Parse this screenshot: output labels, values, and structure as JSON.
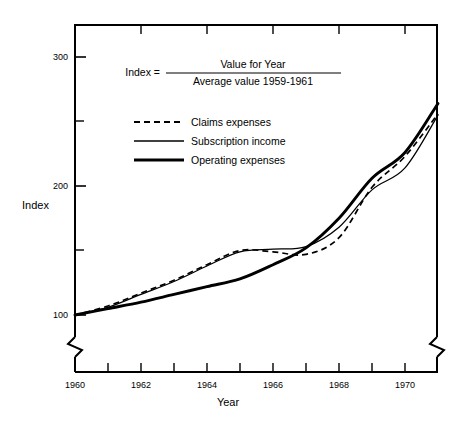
{
  "chart_data": {
    "type": "line",
    "title": "",
    "xlabel": "Year",
    "ylabel": "Index",
    "xlim": [
      1960,
      1971
    ],
    "ylim": [
      95,
      310
    ],
    "grid": false,
    "y_axis_break": true,
    "legend_position": "inside-top-left",
    "x_tick_labels": [
      "1960",
      "1962",
      "1964",
      "1966",
      "1968",
      "1970"
    ],
    "x_tick_label_values": [
      1960,
      1962,
      1964,
      1966,
      1968,
      1970
    ],
    "x_minor_ticks": [
      1961,
      1963,
      1965,
      1967,
      1969,
      1971
    ],
    "y_tick_labels": [
      "100",
      "200",
      "300"
    ],
    "y_tick_label_values": [
      100,
      200,
      300
    ],
    "y_minor_ticks": [
      150,
      250
    ],
    "x": [
      1960,
      1961,
      1962,
      1963,
      1964,
      1965,
      1966,
      1967,
      1968,
      1969,
      1970,
      1971
    ],
    "series": [
      {
        "name": "Claims expenses",
        "style": "dashed",
        "values": [
          100,
          107,
          117,
          127,
          139,
          150,
          149,
          147,
          160,
          199,
          223,
          256
        ]
      },
      {
        "name": "Subscription income",
        "style": "thin-solid",
        "values": [
          100,
          106,
          116,
          126,
          138,
          149,
          151,
          153,
          168,
          197,
          214,
          255
        ]
      },
      {
        "name": "Operating expenses",
        "style": "thick-solid",
        "values": [
          100,
          105,
          110,
          116,
          122,
          128,
          139,
          152,
          175,
          206,
          226,
          264
        ]
      }
    ],
    "annotation": {
      "prefix": "Index =",
      "numerator": "Value for Year",
      "denominator": "Average value 1959-1961"
    }
  },
  "axes": {
    "y_axis_label": "Index",
    "x_axis_label": "Year"
  },
  "legend": {
    "items": [
      {
        "label": "Claims expenses",
        "style": "dashed"
      },
      {
        "label": "Subscription income",
        "style": "thin-solid"
      },
      {
        "label": "Operating expenses",
        "style": "thick-solid"
      }
    ]
  },
  "formula": {
    "prefix": "Index =",
    "numerator": "Value for Year",
    "denominator": "Average value 1959-1961"
  },
  "ticks": {
    "y": [
      {
        "label": "300",
        "value": 300
      },
      {
        "label": "200",
        "value": 200
      },
      {
        "label": "100",
        "value": 100
      }
    ],
    "x": [
      {
        "label": "1960",
        "value": 1960
      },
      {
        "label": "1962",
        "value": 1962
      },
      {
        "label": "1964",
        "value": 1964
      },
      {
        "label": "1966",
        "value": 1966
      },
      {
        "label": "1968",
        "value": 1968
      },
      {
        "label": "1970",
        "value": 1970
      }
    ]
  },
  "colors": {
    "ink": "#000000",
    "background": "#ffffff"
  }
}
